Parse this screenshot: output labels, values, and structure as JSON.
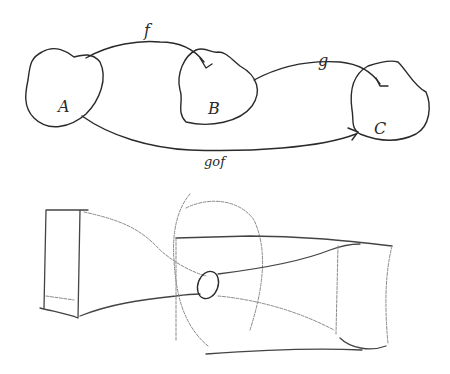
{
  "diagram": {
    "type": "function-composition",
    "nodes": [
      {
        "id": "A",
        "label": "A"
      },
      {
        "id": "B",
        "label": "B"
      },
      {
        "id": "C",
        "label": "C"
      }
    ],
    "edges": [
      {
        "from": "A",
        "to": "B",
        "label": "f"
      },
      {
        "from": "B",
        "to": "C",
        "label": "g"
      },
      {
        "from": "A",
        "to": "C",
        "label": "g∘f",
        "display": "gof"
      }
    ]
  },
  "sketch": {
    "description": "pencil sketch of a funnel / nozzle shape through an oval ring into a box"
  },
  "colors": {
    "ink": "#2a2a2a",
    "pencil": "#8a8a8a",
    "background": "#ffffff"
  }
}
